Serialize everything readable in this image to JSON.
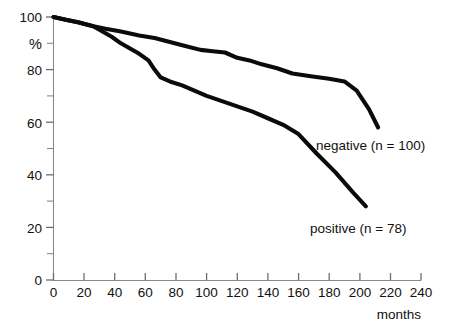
{
  "chart_data": {
    "type": "line",
    "title": "",
    "subtitle": "",
    "xlabel": "months",
    "ylabel": "%",
    "xlim": [
      0,
      240
    ],
    "ylim": [
      0,
      100
    ],
    "grid": false,
    "legend_position": "inline-annotation",
    "x_ticks": [
      0,
      20,
      40,
      60,
      80,
      100,
      120,
      140,
      160,
      180,
      200,
      220,
      240
    ],
    "x_tick_labels": [
      "0",
      "20",
      "40",
      "60",
      "80",
      "100",
      "120",
      "140",
      "160",
      "180",
      "200",
      "220",
      "240"
    ],
    "y_ticks": [
      0,
      10,
      20,
      30,
      40,
      50,
      60,
      70,
      80,
      90,
      100
    ],
    "y_tick_labels": [
      "0",
      "",
      "20",
      "",
      "40",
      "",
      "60",
      "",
      "80",
      "%",
      "100"
    ],
    "series": [
      {
        "name": "negative",
        "label": "negative  (n = 100)",
        "n": 100,
        "x": [
          0,
          8,
          16,
          26,
          34,
          44,
          56,
          66,
          76,
          86,
          96,
          104,
          112,
          120,
          128,
          136,
          146,
          156,
          168,
          180,
          190,
          198,
          206,
          212
        ],
        "values": [
          100,
          99,
          98,
          96.5,
          95.5,
          94.5,
          93,
          92,
          90.5,
          89,
          87.5,
          87,
          86.5,
          84.5,
          83.5,
          82,
          80.5,
          78.5,
          77.5,
          76.5,
          75.5,
          72,
          65,
          58
        ]
      },
      {
        "name": "positive",
        "label": "positive (n = 78)",
        "n": 78,
        "x": [
          0,
          8,
          16,
          26,
          32,
          38,
          44,
          50,
          56,
          62,
          66,
          70,
          76,
          84,
          92,
          100,
          110,
          120,
          130,
          140,
          150,
          160,
          172,
          184,
          196,
          204
        ],
        "values": [
          100,
          99,
          98,
          96.5,
          94.5,
          92.5,
          90,
          88,
          86,
          83.5,
          80,
          77,
          75.5,
          74,
          72,
          70,
          68,
          66,
          64,
          61.5,
          59,
          55.5,
          48,
          41,
          33,
          28
        ]
      }
    ],
    "annotations": [
      {
        "name": "negative-label",
        "text": "negative  (n = 100)",
        "x_px": 316,
        "y_px": 150
      },
      {
        "name": "positive-label",
        "text": "positive (n = 78)",
        "x_px": 310,
        "y_px": 233
      }
    ]
  },
  "axis": {
    "x_title": "months",
    "y_title": "%"
  }
}
